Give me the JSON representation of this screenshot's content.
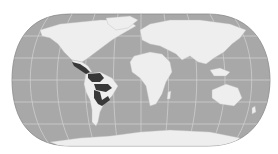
{
  "map": {
    "type": "world-distribution-map",
    "projection": "pseudocylindrical (Eckert IV-like)",
    "colors": {
      "background": "#ffffff",
      "ocean": "#a8a8a8",
      "land": "#eeeeee",
      "graticule": "#d4d4d4",
      "range": "#383838",
      "outline": "#8c8c8c"
    },
    "highlighted_range": {
      "label": "species range",
      "regions": [
        "Central America",
        "northern South America",
        "Amazon basin",
        "central Brazil"
      ]
    },
    "graticule": {
      "parallels_count": 5,
      "meridians_count": 11
    }
  }
}
